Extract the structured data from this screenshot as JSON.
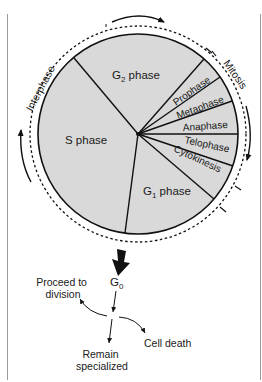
{
  "diagram": {
    "colors": {
      "fill": "#d9d9d9",
      "stroke": "#111111",
      "text": "#1a1a1a"
    },
    "arcs": {
      "interphase": "Interphase",
      "mitosis": "Mitosis"
    },
    "phases": {
      "g2": {
        "main": "G",
        "sub": "2",
        "suffix": " phase"
      },
      "s": "S phase",
      "g1": {
        "main": "G",
        "sub": "1",
        "suffix": " phase"
      },
      "prophase": "Prophase",
      "metaphase": "Metaphase",
      "anaphase": "Anaphase",
      "telophase": "Telophase",
      "cytokinesis": "Cytokinesis"
    },
    "g0": {
      "main": "G",
      "sub": "0"
    },
    "outcomes": {
      "proceed_line1": "Proceed to",
      "proceed_line2": "division",
      "remain_line1": "Remain",
      "remain_line2": "specialized",
      "death": "Cell death"
    }
  }
}
